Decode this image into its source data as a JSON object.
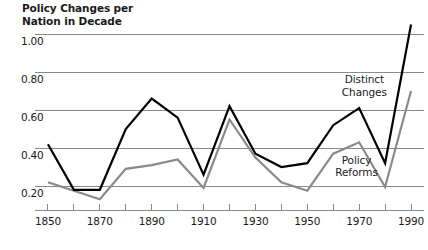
{
  "chart_data": {
    "type": "line",
    "title": "Policy Changes per\nNation in Decade",
    "xlabel": "",
    "ylabel": "Policy Changes per Nation in Decade",
    "xlim": [
      1845,
      1995
    ],
    "ylim": [
      0.08,
      1.1
    ],
    "grid": "horizontal",
    "legend_position": "inline-annotations",
    "x": [
      1850,
      1860,
      1870,
      1880,
      1890,
      1900,
      1910,
      1920,
      1930,
      1940,
      1950,
      1960,
      1970,
      1980,
      1990
    ],
    "xticks_major": [
      1850,
      1870,
      1890,
      1910,
      1930,
      1950,
      1970,
      1990
    ],
    "xticks_minor": [
      1860,
      1880,
      1900,
      1920,
      1940,
      1960,
      1980
    ],
    "xtick_labels": [
      "1850",
      "1870",
      "1890",
      "1910",
      "1930",
      "1950",
      "1970",
      "1990"
    ],
    "yticks": [
      0.2,
      0.4,
      0.6,
      0.8,
      1.0
    ],
    "ytick_labels": [
      "0.20",
      "0.40",
      "0.60",
      "0.80",
      "1.00"
    ],
    "series": [
      {
        "name": "Distinct Changes",
        "color": "#000000",
        "width": 2.2,
        "label_x": 1972,
        "label_y": 0.73,
        "values": [
          0.42,
          0.18,
          0.18,
          0.5,
          0.66,
          0.56,
          0.26,
          0.62,
          0.37,
          0.3,
          0.32,
          0.52,
          0.61,
          0.32,
          1.05
        ]
      },
      {
        "name": "Policy Reforms",
        "color": "#8a8a8a",
        "width": 2.2,
        "label_x": 1969,
        "label_y": 0.305,
        "values": [
          0.22,
          0.175,
          0.13,
          0.29,
          0.31,
          0.34,
          0.19,
          0.55,
          0.35,
          0.22,
          0.175,
          0.37,
          0.43,
          0.195,
          0.7
        ]
      }
    ]
  },
  "style": {
    "gridline_color": "#8a8a8a",
    "axis_color": "#8a8a8a",
    "text_color": "#1a1a1a",
    "background": "#ffffff"
  }
}
